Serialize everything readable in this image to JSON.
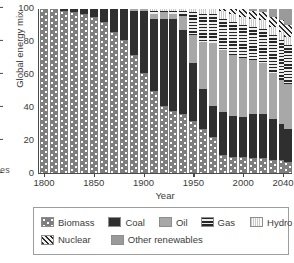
{
  "chart_data": {
    "type": "bar",
    "stacked": true,
    "title": "",
    "xlabel": "Year",
    "ylabel": "Global energy mix",
    "ylim": [
      0,
      100
    ],
    "yticks": [
      0,
      20,
      40,
      60,
      80,
      100
    ],
    "xticks": [
      1800,
      1850,
      1900,
      1950,
      2000,
      2040
    ],
    "xlim": [
      1795,
      2050
    ],
    "grid": false,
    "legend_position": "below-axes",
    "categories": [
      1800,
      1810,
      1820,
      1830,
      1840,
      1850,
      1860,
      1870,
      1880,
      1890,
      1900,
      1910,
      1920,
      1930,
      1940,
      1950,
      1960,
      1970,
      1980,
      1990,
      2000,
      2010,
      2020,
      2030,
      2040,
      2045
    ],
    "series": [
      {
        "name": "Biomass",
        "color": "#7e7e7e",
        "pattern": "dots",
        "values": [
          100,
          100,
          99,
          98,
          97,
          95,
          92,
          86,
          81,
          72,
          61,
          50,
          41,
          38,
          36,
          32,
          27,
          22,
          11,
          10,
          10,
          9,
          9,
          8,
          8,
          7
        ]
      },
      {
        "name": "Coal",
        "color": "#2f2f2f",
        "pattern": "solid",
        "values": [
          0,
          0,
          1,
          2,
          3,
          5,
          8,
          14,
          19,
          27,
          38,
          44,
          53,
          56,
          51,
          35,
          24,
          19,
          26,
          25,
          24,
          27,
          27,
          25,
          22,
          20
        ]
      },
      {
        "name": "Oil",
        "color": "#a8a8a8",
        "pattern": "solid",
        "values": [
          0,
          0,
          0,
          0,
          0,
          0,
          0,
          0,
          0,
          1,
          1,
          3,
          4,
          3,
          9,
          17,
          29,
          38,
          38,
          37,
          36,
          33,
          31,
          28,
          27,
          27
        ]
      },
      {
        "name": "Gas",
        "color": "#262626",
        "pattern": "horizontal-stripes",
        "values": [
          0,
          0,
          0,
          0,
          0,
          0,
          0,
          0,
          0,
          0,
          0,
          2,
          1,
          2,
          3,
          14,
          17,
          18,
          19,
          20,
          20,
          20,
          21,
          23,
          24,
          24
        ]
      },
      {
        "name": "Hydro",
        "color": "#c9c9c9",
        "pattern": "vertical-stripes",
        "values": [
          0,
          0,
          0,
          0,
          0,
          0,
          0,
          0,
          0,
          0,
          0,
          1,
          1,
          1,
          1,
          2,
          3,
          3,
          5,
          5,
          5,
          5,
          5,
          5,
          5,
          5
        ]
      },
      {
        "name": "Nuclear",
        "color": "#2b2b2b",
        "pattern": "diagonal-hatch",
        "values": [
          0,
          0,
          0,
          0,
          0,
          0,
          0,
          0,
          0,
          0,
          0,
          0,
          0,
          0,
          0,
          0,
          0,
          0,
          1,
          3,
          5,
          5,
          5,
          6,
          7,
          7
        ]
      },
      {
        "name": "Other renewables",
        "color": "#9a9a9a",
        "pattern": "solid",
        "values": [
          0,
          0,
          0,
          0,
          0,
          0,
          0,
          0,
          0,
          0,
          0,
          0,
          0,
          0,
          0,
          0,
          0,
          0,
          0,
          0,
          0,
          1,
          2,
          5,
          7,
          10
        ]
      }
    ]
  },
  "axes": {
    "ylabel": "Global energy mix",
    "xlabel": "Year",
    "ytick_labels": [
      "0",
      "20",
      "40",
      "60",
      "80",
      "100"
    ],
    "xtick_labels": [
      "1800",
      "1850",
      "1900",
      "1950",
      "2000",
      "2040"
    ]
  },
  "legend": {
    "rows": [
      [
        {
          "label": "Biomass",
          "swatch": "biomass-pattern-swatch",
          "fill": "f-biomass"
        },
        {
          "label": "Coal",
          "swatch": "coal-pattern-swatch",
          "fill": "f-coal"
        },
        {
          "label": "Oil",
          "swatch": "oil-pattern-swatch",
          "fill": "f-oil"
        },
        {
          "label": "Gas",
          "swatch": "gas-pattern-swatch",
          "fill": "f-gas"
        },
        {
          "label": "Hydro",
          "swatch": "hydro-pattern-swatch",
          "fill": "f-hydro"
        }
      ],
      [
        {
          "label": "Nuclear",
          "swatch": "nuclear-pattern-swatch",
          "fill": "f-nuclear"
        },
        {
          "label": "Other renewables",
          "swatch": "other-renewables-pattern-swatch",
          "fill": "f-other"
        }
      ]
    ]
  },
  "fragments": {
    "left_cut_text": "es"
  }
}
